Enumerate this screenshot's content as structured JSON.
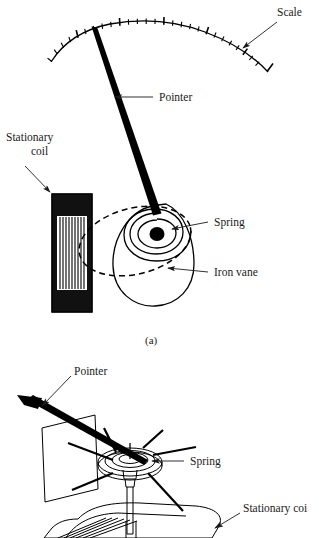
{
  "figure": {
    "background_color": "#ffffff",
    "ink_color": "#000000",
    "label_color": "#1a1a1a"
  },
  "panel_a": {
    "caption": "(a)",
    "labels": {
      "scale": "Scale",
      "pointer": "Pointer",
      "stationary_coil_line1": "Stationary",
      "stationary_coil_line2": "coil",
      "spring": "Spring",
      "iron_vane": "Iron vane"
    },
    "scale_arc": {
      "tick_count": 27,
      "major_tick_every": 5,
      "minor_tick_length": 5,
      "major_tick_length": 9
    },
    "coil": {
      "winding_count": 11,
      "cap_fill": "#111111"
    },
    "spring": {
      "turns": 3
    }
  },
  "panel_b": {
    "labels": {
      "pointer": "Pointer",
      "spring": "Spring",
      "stationary_coil": "Stationary coi"
    },
    "spring": {
      "ring_count": 3,
      "spoke_count": 6
    },
    "coil": {
      "hatch_count": 6
    }
  }
}
